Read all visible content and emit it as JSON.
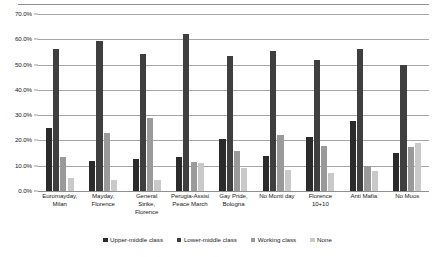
{
  "chart_data": {
    "type": "bar",
    "title": "",
    "subtitle": "",
    "xlabel": "",
    "ylabel": "",
    "ylim": [
      0,
      70
    ],
    "y_tick_labels": [
      "0.0%",
      "10.0%",
      "20.0%",
      "30.0%",
      "40.0%",
      "50.0%",
      "60.0%",
      "70.0%"
    ],
    "y_tick_values": [
      0,
      10,
      20,
      30,
      40,
      50,
      60,
      70
    ],
    "grid": true,
    "legend_position": "bottom",
    "categories": [
      "Euromayday, Milan",
      "Mayday, Florence",
      "General Strike, Florence",
      "Perugia-Assisi Peace March",
      "Gay Pride, Bologna",
      "No Monti day",
      "Florence 10+10",
      "Anti Mafia",
      "No Muos"
    ],
    "category_lines": [
      [
        "Euromayday,",
        "Milan"
      ],
      [
        "Mayday,",
        "Florence"
      ],
      [
        "General",
        "Strike,",
        "Florence"
      ],
      [
        "Perugia-Assisi",
        "Peace March"
      ],
      [
        "Gay Pride,",
        "Bologna"
      ],
      [
        "No Monti day"
      ],
      [
        "Florence",
        "10+10"
      ],
      [
        "Anti Mafia"
      ],
      [
        "No Muos"
      ]
    ],
    "series": [
      {
        "name": "Upper-middle class",
        "color": "#2b2b2b",
        "values": [
          25.0,
          12.0,
          12.5,
          13.5,
          20.5,
          14.0,
          21.5,
          27.5,
          15.0
        ]
      },
      {
        "name": "Lower-middle class",
        "color": "#3f3f3f",
        "values": [
          56.0,
          59.5,
          54.0,
          62.0,
          53.5,
          55.5,
          52.0,
          56.0,
          50.0
        ]
      },
      {
        "name": "Working class",
        "color": "#9a9a9a",
        "values": [
          13.5,
          23.0,
          29.0,
          11.5,
          16.0,
          22.0,
          18.0,
          10.0,
          17.5
        ]
      },
      {
        "name": "None",
        "color": "#c9c9c9",
        "values": [
          5.0,
          4.5,
          4.5,
          11.0,
          9.0,
          8.5,
          7.0,
          8.0,
          19.0
        ]
      }
    ]
  },
  "legend": {
    "items": [
      {
        "label": "Upper-middle class",
        "color": "#2b2b2b"
      },
      {
        "label": "Lower-middle class",
        "color": "#3f3f3f"
      },
      {
        "label": "Working class",
        "color": "#9a9a9a"
      },
      {
        "label": "None",
        "color": "#c9c9c9"
      }
    ]
  }
}
